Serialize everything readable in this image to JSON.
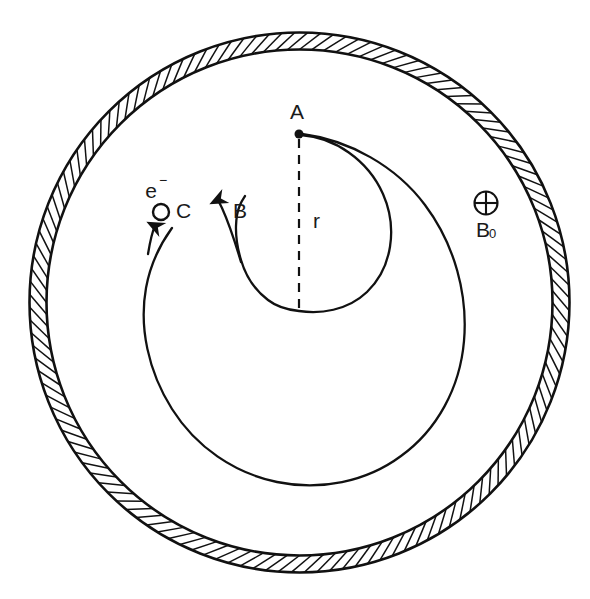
{
  "figure": {
    "background_color": "#ffffff",
    "line_color": "#111111",
    "width": 590,
    "height": 599
  },
  "annulus": {
    "name": "hatched-ring",
    "center_x": 299.5,
    "center_y": 302.5,
    "outer_radius": 270,
    "inner_radius": 253,
    "hatch_count": 132,
    "hatch_skew_degrees": 28
  },
  "labels": {
    "point_a": "A",
    "radius": "r",
    "field_arrow": "B",
    "electron": "e",
    "electron_charge_sign": "−",
    "collector": "C",
    "uniform_field_symbol": "⊕",
    "uniform_field": "B",
    "uniform_field_subscript": "0"
  },
  "geometry": {
    "point_a": {
      "x": 299,
      "y": 134,
      "dot_radius": 4.5
    },
    "radius_line": {
      "x1": 299,
      "y1": 138,
      "x2": 299,
      "y2": 311,
      "dash": "9 7"
    },
    "label_a_pos": {
      "x": 297,
      "y": 113
    },
    "label_r_pos": {
      "x": 313,
      "y": 222
    },
    "label_b_pos": {
      "x": 233,
      "y": 212
    },
    "label_e_pos": {
      "x": 151,
      "y": 192
    },
    "label_c_pos": {
      "x": 176,
      "y": 212
    },
    "collector_circle": {
      "cx": 161,
      "cy": 212,
      "r": 8
    },
    "field_symbol_pos": {
      "x": 486,
      "y": 203,
      "r": 12
    },
    "label_b0_pos": {
      "x": 478,
      "y": 229
    },
    "arrow_b": {
      "tip_x": 218,
      "tip_y": 198
    },
    "arrow_e": {
      "tip_x": 155,
      "tip_y": 224
    }
  },
  "curves": {
    "inner_arc_label": "inner-electron-arc",
    "outer_spiral_label": "outer-electron-spiral"
  }
}
